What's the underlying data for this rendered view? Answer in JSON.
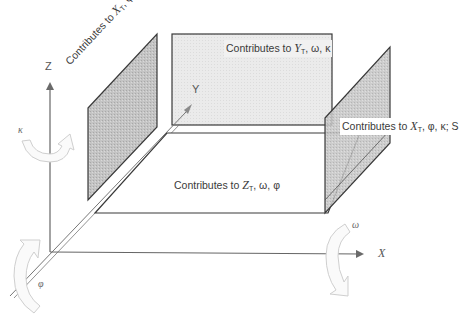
{
  "diagram": {
    "type": "3d-coordinate-system-with-contribution-planes",
    "axes": {
      "x_label": "X",
      "y_label": "Y",
      "z_label": "Z"
    },
    "rotations": {
      "omega": "ω",
      "phi": "φ",
      "kappa": "κ"
    },
    "planes": [
      {
        "id": "left-wall",
        "prefix": "Contributes to ",
        "var": "X",
        "sub": "T",
        "suffix": ", φ, κ, S"
      },
      {
        "id": "back-wall",
        "prefix": "Contributes to ",
        "var": "Y",
        "sub": "T",
        "suffix": ", ω, κ"
      },
      {
        "id": "right-wall",
        "prefix": "Contributes to ",
        "var": "X",
        "sub": "T",
        "suffix": ", φ, κ; S"
      },
      {
        "id": "floor",
        "prefix": "Contributes to ",
        "var": "Z",
        "sub": "T",
        "suffix": ", ω, φ"
      }
    ],
    "colors": {
      "line": "#333333",
      "axis": "#666666",
      "shaded_plane": "#bdbdbd",
      "light_plane": "#ececec",
      "rotation_arrow": "#cfcfcf"
    }
  }
}
